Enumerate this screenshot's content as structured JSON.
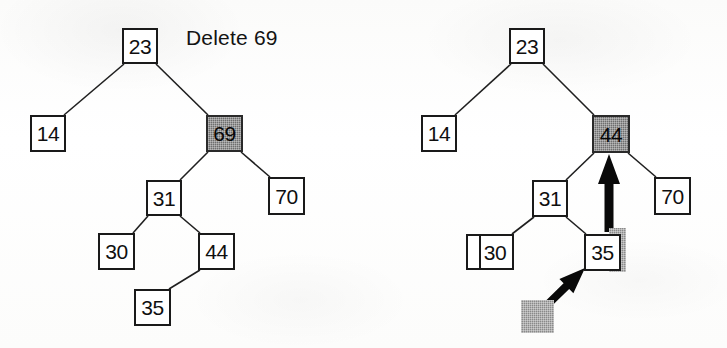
{
  "figure": {
    "title": "Delete 69",
    "caption_label": "binary-search-tree-delete-figure",
    "colors": {
      "ink": "#1a1a1a",
      "paper": "#ffffff",
      "shaded_node_fill": "#6e6e6e",
      "shadow_block_fill": "#8a8a8a",
      "arrow_fill": "#090909"
    }
  },
  "panels": [
    {
      "id": "before",
      "name": "tree-before-deletion",
      "nodes": [
        {
          "id": "b-23",
          "label": "23",
          "x": 122,
          "y": 28,
          "w": 36,
          "h": 36,
          "shaded": false,
          "wide": false
        },
        {
          "id": "b-14",
          "label": "14",
          "x": 30,
          "y": 115,
          "w": 36,
          "h": 37,
          "shaded": false,
          "wide": false
        },
        {
          "id": "b-69",
          "label": "69",
          "x": 206,
          "y": 115,
          "w": 37,
          "h": 37,
          "shaded": true,
          "wide": false
        },
        {
          "id": "b-31",
          "label": "31",
          "x": 146,
          "y": 180,
          "w": 36,
          "h": 36,
          "shaded": false,
          "wide": false
        },
        {
          "id": "b-70",
          "label": "70",
          "x": 268,
          "y": 177,
          "w": 37,
          "h": 38,
          "shaded": false,
          "wide": false
        },
        {
          "id": "b-30",
          "label": "30",
          "x": 98,
          "y": 233,
          "w": 37,
          "h": 37,
          "shaded": false,
          "wide": false
        },
        {
          "id": "b-44",
          "label": "44",
          "x": 198,
          "y": 233,
          "w": 37,
          "h": 37,
          "shaded": false,
          "wide": false
        },
        {
          "id": "b-35",
          "label": "35",
          "x": 134,
          "y": 289,
          "w": 37,
          "h": 37,
          "shaded": false,
          "wide": false
        }
      ],
      "edges": [
        {
          "from": "b-23",
          "to": "b-14"
        },
        {
          "from": "b-23",
          "to": "b-69"
        },
        {
          "from": "b-69",
          "to": "b-31"
        },
        {
          "from": "b-69",
          "to": "b-70"
        },
        {
          "from": "b-31",
          "to": "b-30"
        },
        {
          "from": "b-31",
          "to": "b-44"
        },
        {
          "from": "b-44",
          "to": "b-35"
        }
      ],
      "arrows": [],
      "shadow_blocks": []
    },
    {
      "id": "after",
      "name": "tree-after-deletion",
      "nodes": [
        {
          "id": "a-23",
          "label": "23",
          "x": 509,
          "y": 28,
          "w": 36,
          "h": 36,
          "shaded": false,
          "wide": false
        },
        {
          "id": "a-14",
          "label": "14",
          "x": 421,
          "y": 115,
          "w": 36,
          "h": 37,
          "shaded": false,
          "wide": false
        },
        {
          "id": "a-44",
          "label": "44",
          "x": 592,
          "y": 115,
          "w": 38,
          "h": 38,
          "shaded": true,
          "wide": false
        },
        {
          "id": "a-31",
          "label": "31",
          "x": 532,
          "y": 180,
          "w": 36,
          "h": 37,
          "shaded": false,
          "wide": false
        },
        {
          "id": "a-70",
          "label": "70",
          "x": 654,
          "y": 177,
          "w": 37,
          "h": 38,
          "shaded": false,
          "wide": false
        },
        {
          "id": "a-30",
          "label": "30",
          "x": 466,
          "y": 234,
          "w": 48,
          "h": 36,
          "shaded": false,
          "wide": true
        },
        {
          "id": "a-35",
          "label": "35",
          "x": 584,
          "y": 234,
          "w": 37,
          "h": 37,
          "shaded": false,
          "wide": false
        }
      ],
      "edges": [
        {
          "from": "a-23",
          "to": "a-14"
        },
        {
          "from": "a-23",
          "to": "a-44"
        },
        {
          "from": "a-44",
          "to": "a-31"
        },
        {
          "from": "a-44",
          "to": "a-70"
        },
        {
          "from": "a-31",
          "to": "a-30"
        },
        {
          "from": "a-31",
          "to": "a-35"
        }
      ],
      "arrows": [
        {
          "id": "arrow-up-to-44",
          "name": "move-up-arrow",
          "kind": "vertical-up",
          "from_x": 609,
          "from_y": 232,
          "to_x": 609,
          "to_y": 154
        },
        {
          "id": "arrow-diag-to-35",
          "name": "replace-arrow",
          "kind": "diagonal-up-right",
          "from_x": 543,
          "from_y": 309,
          "to_x": 585,
          "to_y": 268
        }
      ],
      "shadow_blocks": [
        {
          "id": "shadow-35",
          "name": "vacated-slot-shadow",
          "x": 609,
          "y": 228,
          "w": 17,
          "h": 44
        },
        {
          "id": "shadow-empty",
          "name": "removed-node-marker",
          "x": 521,
          "y": 300,
          "w": 33,
          "h": 33
        }
      ]
    }
  ]
}
